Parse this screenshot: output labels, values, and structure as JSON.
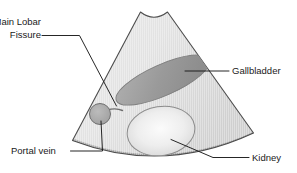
{
  "figure": {
    "background_color": "#ffffff",
    "width": 297,
    "height": 173
  },
  "colors": {
    "sector_fill_light": "#e4e4e4",
    "sector_fill_mid": "#d2d2d2",
    "sector_outline": "#4d4d4d",
    "far_field_band": "#9b9b9b",
    "gallbladder_fill": "#9a9a9a",
    "gallbladder_outline": "#7d7d7d",
    "kidney_fill": "#f0f0f0",
    "kidney_outline": "#8c8c8c",
    "portal_vein_fill": "#a8a8a8",
    "portal_vein_outline": "#707070",
    "fissure_line": "#6e6e6e",
    "leader_line": "#1a1a1a",
    "text": "#1a1a1a"
  },
  "annotations": [
    {
      "id": "main-lobar-fissure",
      "line1": "Main Lobar",
      "line2": "Fissure",
      "position": "top-left"
    },
    {
      "id": "gallbladder",
      "label": "Gallbladder",
      "position": "right"
    },
    {
      "id": "portal-vein",
      "label": "Portal vein",
      "position": "bottom-left"
    },
    {
      "id": "kidney",
      "label": "Kidney",
      "position": "bottom-right"
    }
  ],
  "structures": [
    {
      "id": "scan-sector",
      "name": "ultrasound scan sector"
    },
    {
      "id": "gallbladder-shape",
      "name": "gallbladder"
    },
    {
      "id": "kidney-shape",
      "name": "kidney"
    },
    {
      "id": "portal-vein-shape",
      "name": "portal vein"
    },
    {
      "id": "fissure-shape",
      "name": "main lobar fissure"
    },
    {
      "id": "far-field-band",
      "name": "far field band"
    }
  ]
}
